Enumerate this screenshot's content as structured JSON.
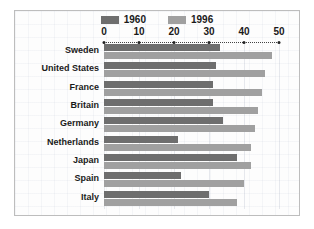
{
  "chart_data": {
    "type": "bar",
    "orientation": "horizontal",
    "title": "",
    "xlabel": "",
    "ylabel": "",
    "xlim": [
      0,
      50
    ],
    "xticks": [
      0,
      10,
      20,
      30,
      40,
      50
    ],
    "xtick_labels": [
      "0",
      "10",
      "20",
      "30",
      "40",
      "50"
    ],
    "grid": true,
    "legend_position": "top-center",
    "categories": [
      "Sweden",
      "United States",
      "France",
      "Britain",
      "Germany",
      "Netherlands",
      "Japan",
      "Spain",
      "Italy"
    ],
    "series": [
      {
        "name": "1960",
        "color": "#6e6e6e",
        "values": [
          33,
          32,
          31,
          31,
          34,
          21,
          38,
          22,
          30
        ]
      },
      {
        "name": "1996",
        "color": "#a0a0a0",
        "values": [
          48,
          46,
          45,
          44,
          43,
          42,
          42,
          40,
          38
        ]
      }
    ]
  },
  "legend": {
    "entries": [
      {
        "label": "1960",
        "color": "#6e6e6e"
      },
      {
        "label": "1996",
        "color": "#a0a0a0"
      }
    ]
  },
  "colors": {
    "series_1960": "#6e6e6e",
    "series_1996": "#a0a0a0",
    "frame_border": "#bdbdbd",
    "plot_background": "#fdfdfd",
    "axis": "#222222",
    "text": "#1a1a1a"
  }
}
